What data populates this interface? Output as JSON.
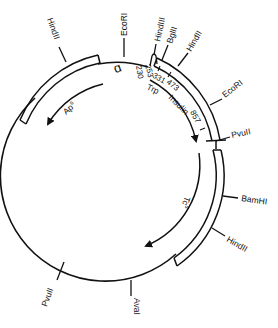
{
  "diagram": {
    "type": "plasmid-map",
    "colors": {
      "line": "#111111",
      "background": "#ffffff"
    },
    "restriction_sites": [
      {
        "label": "HindII",
        "position": "upper-left"
      },
      {
        "label": "EcoRI",
        "position": "top"
      },
      {
        "label": "HindIII",
        "position": "top-right"
      },
      {
        "label": "BglII",
        "position": "top-right"
      },
      {
        "label": "HindII",
        "position": "upper-right"
      },
      {
        "label": "EcoRI",
        "position": "right-upper"
      },
      {
        "label": "PvuII",
        "position": "right"
      },
      {
        "label": "BamHI",
        "position": "right-lower"
      },
      {
        "label": "HindII",
        "position": "lower-right"
      },
      {
        "label": "AvaI",
        "position": "bottom"
      },
      {
        "label": "PvuII",
        "position": "lower-left"
      }
    ],
    "coordinates": [
      "230",
      "253",
      "331",
      "473",
      "857"
    ],
    "genes": [
      {
        "label": "ApR",
        "text": "Ap",
        "superscript": "s"
      },
      {
        "label": "Trp",
        "text": "Trp"
      },
      {
        "label": "Insulin",
        "text": "Insulin"
      },
      {
        "label": "TcR",
        "text": "Tc",
        "superscript": "s"
      }
    ],
    "origin_symbol": "ɑ"
  }
}
